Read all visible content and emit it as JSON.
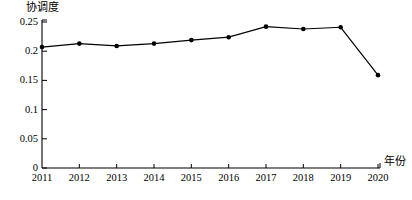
{
  "chart_data": {
    "type": "line",
    "title": "",
    "subtitle": "",
    "xlabel": "年份",
    "ylabel": "协调度",
    "categories": [
      "2011",
      "2012",
      "2013",
      "2014",
      "2015",
      "2016",
      "2017",
      "2018",
      "2019",
      "2020"
    ],
    "x": [
      2011,
      2012,
      2013,
      2014,
      2015,
      2016,
      2017,
      2018,
      2019,
      2020
    ],
    "values": [
      0.207,
      0.213,
      0.209,
      0.213,
      0.219,
      0.224,
      0.242,
      0.238,
      0.241,
      0.159
    ],
    "series": [
      {
        "name": "协调度",
        "values": [
          0.207,
          0.213,
          0.209,
          0.213,
          0.219,
          0.224,
          0.242,
          0.238,
          0.241,
          0.159
        ]
      }
    ],
    "ylim": [
      0,
      0.25
    ],
    "xlim": [
      2011,
      2020
    ],
    "yticks": [
      0,
      0.05,
      0.1,
      0.15,
      0.2,
      0.25
    ],
    "ytick_labels": [
      "0",
      "0.05",
      "0.1",
      "0.15",
      "0.2",
      "0.25"
    ],
    "xtick_labels": [
      "2011",
      "2012",
      "2013",
      "2014",
      "2015",
      "2016",
      "2017",
      "2018",
      "2019",
      "2020"
    ],
    "grid": false,
    "legend": "none",
    "marker": "filled-circle",
    "line_color": "#000000",
    "marker_color": "#000000",
    "axis_color": "#000000",
    "background_color": "#ffffff"
  },
  "axes": {
    "y_title": "协调度",
    "x_title": "年份"
  },
  "y_ticks": [
    {
      "label": "0.25",
      "value": 0.25
    },
    {
      "label": "0.2",
      "value": 0.2
    },
    {
      "label": "0.15",
      "value": 0.15
    },
    {
      "label": "0.1",
      "value": 0.1
    },
    {
      "label": "0.05",
      "value": 0.05
    },
    {
      "label": "0",
      "value": 0
    }
  ],
  "x_ticks": [
    {
      "label": "2011"
    },
    {
      "label": "2012"
    },
    {
      "label": "2013"
    },
    {
      "label": "2014"
    },
    {
      "label": "2015"
    },
    {
      "label": "2016"
    },
    {
      "label": "2017"
    },
    {
      "label": "2018"
    },
    {
      "label": "2019"
    },
    {
      "label": "2020"
    }
  ]
}
